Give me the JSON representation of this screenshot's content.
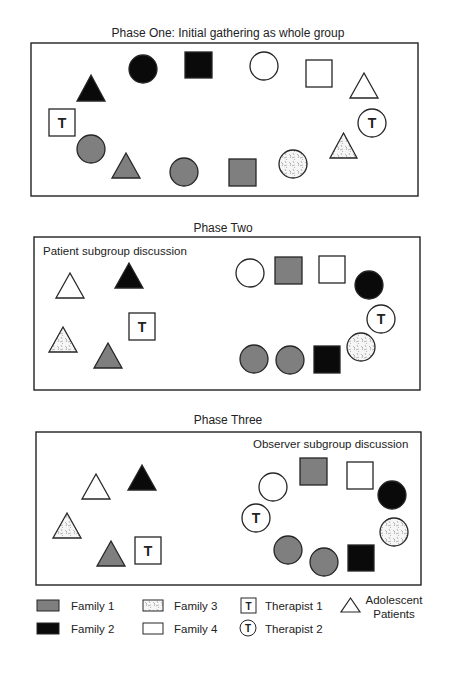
{
  "colors": {
    "family1": "#7f7f7f",
    "family2": "#0a0a0a",
    "family3_bg": "#f6f6f6",
    "family3_mark": "#8a8a8a",
    "family4": "#ffffff",
    "stroke": "#262626",
    "patient_triangle": "#ffffff"
  },
  "phases": [
    {
      "title": "Phase One: Initial gathering as whole group",
      "title_pos": [
        228,
        37
      ],
      "box": [
        31,
        43,
        387,
        153
      ],
      "subgroup_label": "",
      "subgroup_label_pos": [
        0,
        0
      ],
      "members": [
        {
          "shape": "triangle",
          "role": "patient",
          "family": "family2",
          "x": 77,
          "y": 75,
          "w": 28,
          "h": 26
        },
        {
          "shape": "circle",
          "role": "parent",
          "family": "family2",
          "cx": 143,
          "cy": 69,
          "r": 14
        },
        {
          "shape": "square",
          "role": "parent",
          "family": "family2",
          "x": 185,
          "y": 52,
          "w": 27,
          "h": 26
        },
        {
          "shape": "circle",
          "role": "parent",
          "family": "family4",
          "cx": 264,
          "cy": 66,
          "r": 14
        },
        {
          "shape": "square",
          "role": "parent",
          "family": "family4",
          "x": 306,
          "y": 60,
          "w": 26,
          "h": 27
        },
        {
          "shape": "triangle",
          "role": "patient",
          "family": "family4",
          "x": 350,
          "y": 73,
          "w": 28,
          "h": 25
        },
        {
          "shape": "therapist-circle",
          "role": "therapist2",
          "family": "family4",
          "cx": 372,
          "cy": 123,
          "r": 14,
          "label": "T"
        },
        {
          "shape": "triangle",
          "role": "patient",
          "family": "family3",
          "x": 330,
          "y": 133,
          "w": 27,
          "h": 25
        },
        {
          "shape": "circle",
          "role": "parent",
          "family": "family3",
          "cx": 293,
          "cy": 164,
          "r": 14
        },
        {
          "shape": "square",
          "role": "parent",
          "family": "family1",
          "x": 229,
          "y": 159,
          "w": 27,
          "h": 27
        },
        {
          "shape": "circle",
          "role": "parent",
          "family": "family1",
          "cx": 184,
          "cy": 172,
          "r": 14
        },
        {
          "shape": "triangle",
          "role": "patient",
          "family": "family1",
          "x": 112,
          "y": 153,
          "w": 28,
          "h": 25
        },
        {
          "shape": "circle",
          "role": "parent",
          "family": "family1",
          "cx": 91,
          "cy": 149,
          "r": 14
        },
        {
          "shape": "therapist-square",
          "role": "therapist1",
          "family": "family4",
          "x": 49,
          "y": 109,
          "w": 26,
          "h": 27,
          "label": "T"
        }
      ]
    },
    {
      "title": "Phase Two",
      "title_pos": [
        223,
        232
      ],
      "box": [
        34,
        237,
        386,
        153
      ],
      "subgroup_label": "Patient subgroup discussion",
      "subgroup_label_pos": [
        43,
        255
      ],
      "members": [
        {
          "shape": "triangle",
          "role": "patient",
          "family": "family4",
          "x": 56,
          "y": 273,
          "w": 28,
          "h": 25
        },
        {
          "shape": "triangle",
          "role": "patient",
          "family": "family2",
          "x": 115,
          "y": 263,
          "w": 28,
          "h": 25
        },
        {
          "shape": "therapist-square",
          "role": "therapist1",
          "family": "family4",
          "x": 129,
          "y": 313,
          "w": 26,
          "h": 27,
          "label": "T"
        },
        {
          "shape": "triangle",
          "role": "patient",
          "family": "family3",
          "x": 49,
          "y": 327,
          "w": 28,
          "h": 25
        },
        {
          "shape": "triangle",
          "role": "patient",
          "family": "family1",
          "x": 94,
          "y": 343,
          "w": 28,
          "h": 25
        },
        {
          "shape": "circle",
          "role": "parent",
          "family": "family4",
          "cx": 250,
          "cy": 273,
          "r": 14
        },
        {
          "shape": "square",
          "role": "parent",
          "family": "family1",
          "x": 275,
          "y": 257,
          "w": 27,
          "h": 27
        },
        {
          "shape": "square",
          "role": "parent",
          "family": "family4",
          "x": 319,
          "y": 256,
          "w": 26,
          "h": 27
        },
        {
          "shape": "circle",
          "role": "parent",
          "family": "family2",
          "cx": 369,
          "cy": 285,
          "r": 14
        },
        {
          "shape": "therapist-circle",
          "role": "therapist2",
          "family": "family4",
          "cx": 381,
          "cy": 319,
          "r": 14,
          "label": "T"
        },
        {
          "shape": "circle",
          "role": "parent",
          "family": "family3",
          "cx": 361,
          "cy": 347,
          "r": 14
        },
        {
          "shape": "square",
          "role": "parent",
          "family": "family2",
          "x": 314,
          "y": 346,
          "w": 26,
          "h": 27
        },
        {
          "shape": "circle",
          "role": "parent",
          "family": "family1",
          "cx": 290,
          "cy": 360,
          "r": 14
        },
        {
          "shape": "circle",
          "role": "parent",
          "family": "family1",
          "cx": 254,
          "cy": 359,
          "r": 14
        }
      ]
    },
    {
      "title": "Phase Three",
      "title_pos": [
        228,
        424
      ],
      "box": [
        36,
        432,
        385,
        153
      ],
      "subgroup_label": "Observer subgroup discussion",
      "subgroup_label_pos": [
        253,
        448
      ],
      "members": [
        {
          "shape": "triangle",
          "role": "patient",
          "family": "family4",
          "x": 82,
          "y": 474,
          "w": 28,
          "h": 25
        },
        {
          "shape": "triangle",
          "role": "patient",
          "family": "family2",
          "x": 128,
          "y": 465,
          "w": 28,
          "h": 25
        },
        {
          "shape": "triangle",
          "role": "patient",
          "family": "family3",
          "x": 53,
          "y": 513,
          "w": 28,
          "h": 25
        },
        {
          "shape": "triangle",
          "role": "patient",
          "family": "family1",
          "x": 97,
          "y": 541,
          "w": 28,
          "h": 25
        },
        {
          "shape": "therapist-square",
          "role": "therapist1",
          "family": "family4",
          "x": 135,
          "y": 537,
          "w": 26,
          "h": 27,
          "label": "T"
        },
        {
          "shape": "circle",
          "role": "parent",
          "family": "family4",
          "cx": 273,
          "cy": 487,
          "r": 14
        },
        {
          "shape": "square",
          "role": "parent",
          "family": "family1",
          "x": 300,
          "y": 458,
          "w": 27,
          "h": 27
        },
        {
          "shape": "square",
          "role": "parent",
          "family": "family4",
          "x": 347,
          "y": 462,
          "w": 26,
          "h": 27
        },
        {
          "shape": "circle",
          "role": "parent",
          "family": "family2",
          "cx": 392,
          "cy": 495,
          "r": 14
        },
        {
          "shape": "therapist-circle",
          "role": "therapist2",
          "family": "family4",
          "cx": 256,
          "cy": 518,
          "r": 14,
          "label": "T"
        },
        {
          "shape": "circle",
          "role": "parent",
          "family": "family3",
          "cx": 394,
          "cy": 532,
          "r": 14
        },
        {
          "shape": "square",
          "role": "parent",
          "family": "family2",
          "x": 348,
          "y": 545,
          "w": 26,
          "h": 26
        },
        {
          "shape": "circle",
          "role": "parent",
          "family": "family1",
          "cx": 324,
          "cy": 562,
          "r": 14
        },
        {
          "shape": "circle",
          "role": "parent",
          "family": "family1",
          "cx": 288,
          "cy": 550,
          "r": 14
        }
      ]
    }
  ],
  "legend": {
    "items": [
      {
        "key": "family1",
        "label": "Family 1",
        "swatch": "rect",
        "x": 37,
        "y": 600,
        "w": 22,
        "h": 11,
        "text_x": 71,
        "text_y": 610
      },
      {
        "key": "family2",
        "label": "Family 2",
        "swatch": "rect",
        "x": 37,
        "y": 623,
        "w": 22,
        "h": 11,
        "text_x": 71,
        "text_y": 633
      },
      {
        "key": "family3",
        "label": "Family 3",
        "swatch": "rect",
        "x": 143,
        "y": 600,
        "w": 20,
        "h": 11,
        "text_x": 174,
        "text_y": 610
      },
      {
        "key": "family4",
        "label": "Family 4",
        "swatch": "rect",
        "x": 143,
        "y": 623,
        "w": 20,
        "h": 11,
        "text_x": 174,
        "text_y": 633
      },
      {
        "key": "therapist1",
        "label": "Therapist 1",
        "swatch": "therapist-square",
        "x": 241,
        "y": 598,
        "w": 15,
        "h": 15,
        "symbol": "T",
        "text_x": 265,
        "text_y": 610
      },
      {
        "key": "therapist2",
        "label": "Therapist 2",
        "swatch": "therapist-circle",
        "cx": 248,
        "cy": 628,
        "r": 8,
        "symbol": "T",
        "text_x": 265,
        "text_y": 633
      },
      {
        "key": "patients",
        "label": "Adolescent",
        "label2": "Patients",
        "swatch": "triangle",
        "x": 341,
        "y": 598,
        "w": 19,
        "h": 14,
        "text_x": 394,
        "text_y": 604,
        "text2_y": 618
      }
    ]
  }
}
